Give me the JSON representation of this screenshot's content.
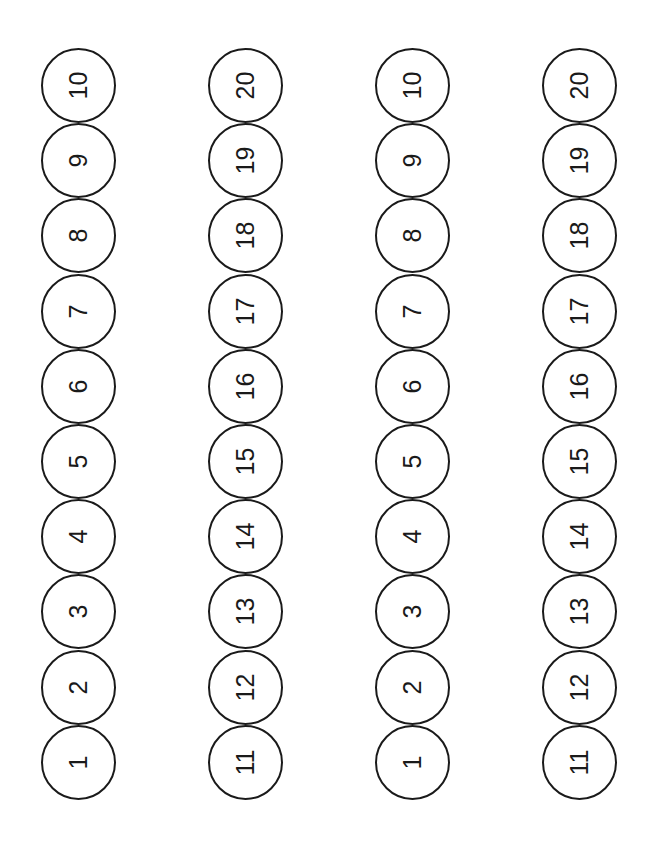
{
  "page": {
    "background_color": "#ffffff",
    "stroke_color": "#1a1a1a",
    "text_color": "#1a1a1a",
    "text_rotation_deg": -90,
    "circle_diameter_px": 75,
    "stroke_width_px": 2
  },
  "strips": [
    {
      "name": "strip-1",
      "range_label": "1-10",
      "tokens": [
        {
          "value": "10"
        },
        {
          "value": "9"
        },
        {
          "value": "8"
        },
        {
          "value": "7"
        },
        {
          "value": "6"
        },
        {
          "value": "5"
        },
        {
          "value": "4"
        },
        {
          "value": "3"
        },
        {
          "value": "2"
        },
        {
          "value": "1"
        }
      ]
    },
    {
      "name": "strip-2",
      "range_label": "11-20",
      "tokens": [
        {
          "value": "20"
        },
        {
          "value": "19"
        },
        {
          "value": "18"
        },
        {
          "value": "17"
        },
        {
          "value": "16"
        },
        {
          "value": "15"
        },
        {
          "value": "14"
        },
        {
          "value": "13"
        },
        {
          "value": "12"
        },
        {
          "value": "11"
        }
      ]
    },
    {
      "name": "strip-3",
      "range_label": "1-10",
      "tokens": [
        {
          "value": "10"
        },
        {
          "value": "9"
        },
        {
          "value": "8"
        },
        {
          "value": "7"
        },
        {
          "value": "6"
        },
        {
          "value": "5"
        },
        {
          "value": "4"
        },
        {
          "value": "3"
        },
        {
          "value": "2"
        },
        {
          "value": "1"
        }
      ]
    },
    {
      "name": "strip-4",
      "range_label": "11-20",
      "tokens": [
        {
          "value": "20"
        },
        {
          "value": "19"
        },
        {
          "value": "18"
        },
        {
          "value": "17"
        },
        {
          "value": "16"
        },
        {
          "value": "15"
        },
        {
          "value": "14"
        },
        {
          "value": "13"
        },
        {
          "value": "12"
        },
        {
          "value": "11"
        }
      ]
    }
  ]
}
